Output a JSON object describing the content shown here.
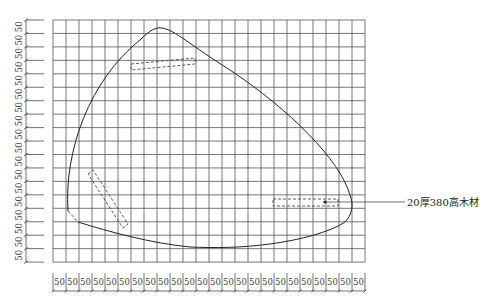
{
  "drawing": {
    "grid": {
      "left": 53,
      "top": 20,
      "cols": 24,
      "rows": 18,
      "col_width": 13,
      "row_height": 13.45,
      "line_color": "#555555"
    },
    "dimensions": {
      "left_label": "50",
      "left_count": 18,
      "bottom_label": "50",
      "bottom_count": 24
    },
    "annotation": {
      "label": "20厚380高木材",
      "leader_start": [
        325,
        202
      ],
      "leader_end": [
        405,
        202
      ]
    }
  }
}
